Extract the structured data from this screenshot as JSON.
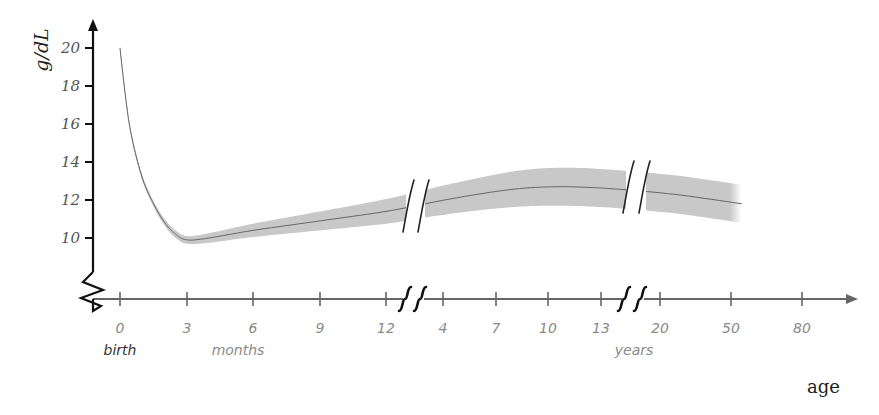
{
  "chart_data": {
    "type": "area",
    "title": "",
    "ylabel": "g/dL",
    "xlabel": "age",
    "ylim": [
      8,
      21
    ],
    "y_ticks": [
      10,
      12,
      14,
      16,
      18,
      20
    ],
    "y_axis_break": true,
    "x_segments": [
      {
        "unit": "months",
        "ticks": [
          0,
          3,
          6,
          9,
          12
        ],
        "unit_label": "months",
        "start_label": "birth"
      },
      {
        "unit": "years",
        "ticks": [
          4,
          7,
          10,
          13
        ]
      },
      {
        "unit": "years",
        "ticks": [
          20,
          50,
          80
        ],
        "unit_label": "years"
      }
    ],
    "x_tick_labels": [
      "0",
      "3",
      "6",
      "9",
      "12",
      "4",
      "7",
      "10",
      "13",
      "20",
      "50",
      "80"
    ],
    "x_breaks_after": [
      "12 months",
      "13 years"
    ],
    "series": [
      {
        "name": "mean hemoglobin",
        "color": "#666666",
        "points": [
          {
            "age": "0 mo",
            "pos": 0.0,
            "value": 20.0
          },
          {
            "age": "0.25 mo",
            "pos": 0.08,
            "value": 17.5
          },
          {
            "age": "0.5 mo",
            "pos": 0.17,
            "value": 15.4
          },
          {
            "age": "1 mo",
            "pos": 0.33,
            "value": 13.2
          },
          {
            "age": "1.5 mo",
            "pos": 0.5,
            "value": 11.8
          },
          {
            "age": "2 mo",
            "pos": 0.67,
            "value": 10.8
          },
          {
            "age": "2.5 mo",
            "pos": 0.83,
            "value": 10.2
          },
          {
            "age": "3 mo",
            "pos": 1.0,
            "value": 9.9
          },
          {
            "age": "4 mo",
            "pos": 1.33,
            "value": 10.0
          },
          {
            "age": "6 mo",
            "pos": 2.0,
            "value": 10.4
          },
          {
            "age": "9 mo",
            "pos": 3.0,
            "value": 10.9
          },
          {
            "age": "12 mo",
            "pos": 4.0,
            "value": 11.4
          },
          {
            "age": "4 yr",
            "pos": 4.85,
            "value": 11.9
          },
          {
            "age": "7 yr",
            "pos": 5.65,
            "value": 12.3
          },
          {
            "age": "10 yr",
            "pos": 6.45,
            "value": 12.6
          },
          {
            "age": "13 yr",
            "pos": 7.25,
            "value": 12.7
          },
          {
            "age": "20 yr",
            "pos": 8.15,
            "value": 12.6
          },
          {
            "age": "50 yr",
            "pos": 9.2,
            "value": 12.3
          },
          {
            "age": "80 yr",
            "pos": 10.15,
            "value": 11.8
          }
        ]
      },
      {
        "name": "normal range band",
        "color": "#c8c8c8",
        "half_width": [
          0.15,
          0.15,
          0.15,
          0.15,
          0.15,
          0.18,
          0.2,
          0.2,
          0.25,
          0.35,
          0.5,
          0.65,
          0.75,
          0.85,
          0.95,
          1.0,
          1.0,
          1.0,
          1.0
        ]
      }
    ],
    "grid": false,
    "legend": "none"
  },
  "labels": {
    "y_title": "g/dL",
    "x_title": "age",
    "birth": "birth",
    "months": "months",
    "years": "years"
  },
  "colors": {
    "axis_y": "#111111",
    "axis_x": "#666666",
    "band": "#c8c8c8",
    "line": "#666666",
    "break_marks": "#111111"
  }
}
